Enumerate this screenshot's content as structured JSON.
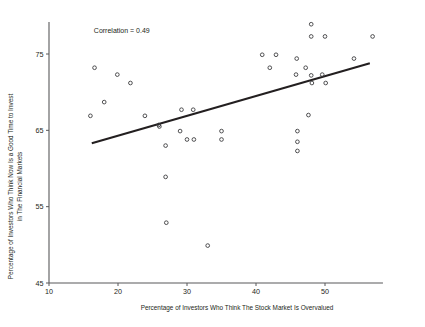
{
  "chart_data": {
    "type": "scatter",
    "title": "",
    "subtitle": "",
    "xlabel": "Percentage of Investors Who Think The Stock Market Is Overvalued",
    "ylabel_line1": "Percentage of Investors Who Think Now Is a Good Time to Invest",
    "ylabel_line2": "in The Financial Markets",
    "xlim": [
      10,
      58
    ],
    "ylim": [
      45,
      79
    ],
    "xticks": [
      10,
      20,
      30,
      40,
      50
    ],
    "yticks": [
      45,
      55,
      65,
      75
    ],
    "xtick_labels": [
      "10",
      "20",
      "30",
      "40",
      "50"
    ],
    "ytick_labels": [
      "45",
      "55",
      "65",
      "75"
    ],
    "grid": false,
    "legend": "none",
    "annotations": [
      {
        "name": "correlation-annotation",
        "text": "Correlation = 0.49",
        "x": 16.5,
        "y": 77.8
      }
    ],
    "series": [
      {
        "name": "Investor sentiment survey points",
        "marker": "open-circle",
        "marker_color": "#3d3d3f",
        "points": [
          [
            16.0,
            66.9
          ],
          [
            16.6,
            73.2
          ],
          [
            18.0,
            68.7
          ],
          [
            19.9,
            72.3
          ],
          [
            21.8,
            71.2
          ],
          [
            23.9,
            66.9
          ],
          [
            25.9,
            65.7
          ],
          [
            26.0,
            65.5
          ],
          [
            26.9,
            63.0
          ],
          [
            26.9,
            58.9
          ],
          [
            27.0,
            52.9
          ],
          [
            29.0,
            64.9
          ],
          [
            29.2,
            67.7
          ],
          [
            30.0,
            63.8
          ],
          [
            30.9,
            67.7
          ],
          [
            31.0,
            63.8
          ],
          [
            33.0,
            49.9
          ],
          [
            35.0,
            64.9
          ],
          [
            35.0,
            63.8
          ],
          [
            40.9,
            74.9
          ],
          [
            42.0,
            73.2
          ],
          [
            42.9,
            74.9
          ],
          [
            45.8,
            72.3
          ],
          [
            45.9,
            74.4
          ],
          [
            46.0,
            64.9
          ],
          [
            46.0,
            63.5
          ],
          [
            46.0,
            62.3
          ],
          [
            47.2,
            73.2
          ],
          [
            47.6,
            67.0
          ],
          [
            48.0,
            78.9
          ],
          [
            48.0,
            77.3
          ],
          [
            48.0,
            72.2
          ],
          [
            48.1,
            71.2
          ],
          [
            49.6,
            72.3
          ],
          [
            50.0,
            77.3
          ],
          [
            50.1,
            71.2
          ],
          [
            54.2,
            74.4
          ],
          [
            56.9,
            77.3
          ]
        ]
      }
    ],
    "fit_line": {
      "name": "linear-regression-line",
      "color": "#231f20",
      "x_start": 16.2,
      "y_start": 63.3,
      "x_end": 56.5,
      "y_end": 73.8
    }
  }
}
